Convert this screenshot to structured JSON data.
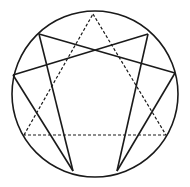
{
  "diagram": {
    "type": "enneagram",
    "background": "#ffffff",
    "stroke_color": "#1a1a1a",
    "circle": {
      "cx": 95,
      "cy": 94,
      "r": 83
    },
    "points": {
      "9": [
        93,
        14
      ],
      "1": [
        148,
        34
      ],
      "2": [
        175,
        73
      ],
      "3": [
        166,
        135
      ],
      "4": [
        117,
        171
      ],
      "5": [
        73,
        171
      ],
      "6": [
        24,
        135
      ],
      "7": [
        13,
        75
      ],
      "8": [
        39,
        34
      ]
    },
    "solid_edges": [
      [
        "1",
        "4"
      ],
      [
        "4",
        "2"
      ],
      [
        "2",
        "8"
      ],
      [
        "8",
        "5"
      ],
      [
        "5",
        "7"
      ],
      [
        "7",
        "1"
      ]
    ],
    "dashed_edges": [
      [
        "9",
        "3"
      ],
      [
        "3",
        "6"
      ],
      [
        "6",
        "9"
      ]
    ]
  }
}
